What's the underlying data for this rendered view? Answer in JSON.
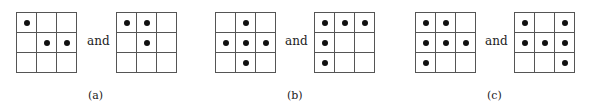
{
  "connector": "and",
  "panels": [
    {
      "caption": "(a)",
      "left": [
        [
          1,
          0,
          0
        ],
        [
          0,
          1,
          1
        ],
        [
          0,
          0,
          0
        ]
      ],
      "right": [
        [
          1,
          1,
          0
        ],
        [
          0,
          1,
          0
        ],
        [
          0,
          0,
          0
        ]
      ]
    },
    {
      "caption": "(b)",
      "left": [
        [
          0,
          1,
          0
        ],
        [
          1,
          1,
          1
        ],
        [
          0,
          1,
          0
        ]
      ],
      "right": [
        [
          1,
          1,
          1
        ],
        [
          1,
          0,
          0
        ],
        [
          1,
          0,
          0
        ]
      ]
    },
    {
      "caption": "(c)",
      "left": [
        [
          1,
          1,
          0
        ],
        [
          1,
          1,
          1
        ],
        [
          1,
          0,
          0
        ]
      ],
      "right": [
        [
          1,
          0,
          1
        ],
        [
          1,
          1,
          1
        ],
        [
          0,
          0,
          1
        ]
      ]
    }
  ]
}
